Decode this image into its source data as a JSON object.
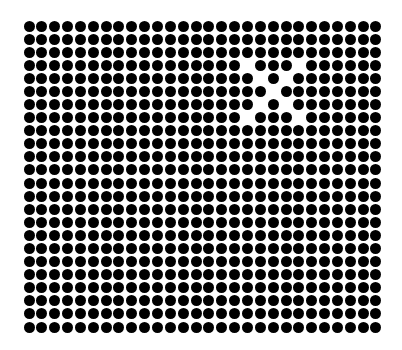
{
  "image": {
    "description": "Grid of black dots on white background with an X-shaped pattern of missing dots in the upper right",
    "background_color": "#ffffff",
    "dot_color": "#000000"
  },
  "grid": {
    "columns": 28,
    "rows": 24,
    "origin_center_x": 29,
    "origin_center_y": 26,
    "spacing_x": 12.85,
    "spacing_y": 13.09,
    "dot_diameter": 11
  },
  "missing_dots": [
    {
      "row": 3,
      "col": 17
    },
    {
      "row": 3,
      "col": 21
    },
    {
      "row": 4,
      "col": 18
    },
    {
      "row": 4,
      "col": 20
    },
    {
      "row": 5,
      "col": 19
    },
    {
      "row": 6,
      "col": 18
    },
    {
      "row": 6,
      "col": 20
    },
    {
      "row": 7,
      "col": 17
    },
    {
      "row": 7,
      "col": 21
    }
  ],
  "pattern": {
    "shape": "X",
    "rows_span": [
      3,
      7
    ],
    "cols_span": [
      17,
      21
    ]
  }
}
